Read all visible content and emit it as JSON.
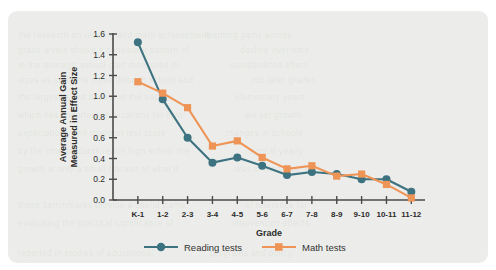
{
  "figure": {
    "panel_color": "#ecedea",
    "background_color": "#ffffff"
  },
  "chart_data": {
    "type": "line",
    "title": "",
    "xlabel": "Grade",
    "ylabel": "Average Annual Gain Measured in Effect Size",
    "ylabel_line1": "Average Annual Gain",
    "ylabel_line2": "Measured in Effect Size",
    "categories": [
      "K-1",
      "1-2",
      "2-3",
      "3-4",
      "4-5",
      "5-6",
      "6-7",
      "7-8",
      "8-9",
      "9-10",
      "10-11",
      "11-12"
    ],
    "ylim": [
      0.0,
      1.6
    ],
    "ytick_labels": [
      "0.0",
      "0.2",
      "0.4",
      "0.6",
      "0.8",
      "1.0",
      "1.2",
      "1.4",
      "1.6"
    ],
    "ytick_values": [
      0.0,
      0.2,
      0.4,
      0.6,
      0.8,
      1.0,
      1.2,
      1.4,
      1.6
    ],
    "grid": false,
    "legend_position": "bottom",
    "series": [
      {
        "name": "Reading tests",
        "color": "#3d7280",
        "marker": "circle",
        "values": [
          1.52,
          0.97,
          0.6,
          0.36,
          0.41,
          0.33,
          0.24,
          0.27,
          0.25,
          0.2,
          0.2,
          0.08
        ]
      },
      {
        "name": "Math tests",
        "color": "#ef9457",
        "marker": "square",
        "values": [
          1.14,
          1.03,
          0.89,
          0.52,
          0.57,
          0.41,
          0.3,
          0.33,
          0.23,
          0.25,
          0.15,
          0.02
        ]
      }
    ]
  },
  "ghost_text": [
    {
      "x": 18,
      "y": 30,
      "text": "the research on reading and math achievement"
    },
    {
      "x": 205,
      "y": 30,
      "text": "learning gains across"
    },
    {
      "x": 18,
      "y": 45,
      "text": "grade levels shows a consistent pattern of"
    },
    {
      "x": 240,
      "y": 45,
      "text": "decline over time"
    },
    {
      "x": 18,
      "y": 60,
      "text": "in the average annual gain measured in"
    },
    {
      "x": 230,
      "y": 60,
      "text": "standardized effect"
    },
    {
      "x": 18,
      "y": 75,
      "text": "sizes as students move through school and"
    },
    {
      "x": 250,
      "y": 75,
      "text": "into later grades"
    },
    {
      "x": 18,
      "y": 92,
      "text": "the largest gains appear in the earliest"
    },
    {
      "x": 235,
      "y": 92,
      "text": "elementary years"
    },
    {
      "x": 18,
      "y": 110,
      "text": "which has important implications for how"
    },
    {
      "x": 245,
      "y": 110,
      "text": "we set growth"
    },
    {
      "x": 18,
      "y": 128,
      "text": "expectations and interpret test score"
    },
    {
      "x": 225,
      "y": 128,
      "text": "changes in schools"
    },
    {
      "x": 18,
      "y": 146,
      "text": "by the time students reach high school the"
    },
    {
      "x": 250,
      "y": 146,
      "text": "typical yearly"
    },
    {
      "x": 18,
      "y": 164,
      "text": "growth is only a small fraction of what it"
    },
    {
      "x": 235,
      "y": 164,
      "text": "was in kindergarten"
    },
    {
      "x": 18,
      "y": 200,
      "text": "these benchmarks provide a useful frame"
    },
    {
      "x": 245,
      "y": 200,
      "text": "of reference for"
    },
    {
      "x": 18,
      "y": 218,
      "text": "evaluating the practical significance of"
    },
    {
      "x": 232,
      "y": 218,
      "text": "intervention effects"
    },
    {
      "x": 18,
      "y": 248,
      "text": "reported in studies of educational"
    },
    {
      "x": 210,
      "y": 248,
      "text": "programs and policy"
    }
  ]
}
